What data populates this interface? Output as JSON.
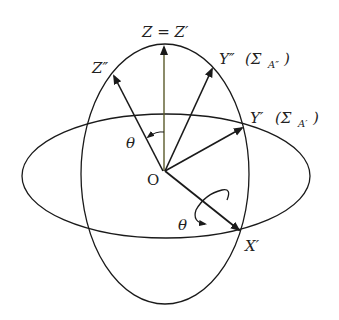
{
  "diagram": {
    "type": "rotation-of-axes",
    "labels": {
      "z_equal": "Z = Z′",
      "z_double": "Z″",
      "y_double": "Y″",
      "y_double_paren": "(Σ",
      "y_double_sub": "A″",
      "y_double_close": ")",
      "y_prime": "Y′",
      "y_prime_paren": "(Σ",
      "y_prime_sub": "A′",
      "y_prime_close": ")",
      "origin": "O",
      "theta_upper": "θ",
      "theta_lower": "θ",
      "x_prime": "X′"
    },
    "colors": {
      "line": "#1a1a1a",
      "z_axis": "#5a5a2a",
      "background": "#ffffff"
    }
  }
}
